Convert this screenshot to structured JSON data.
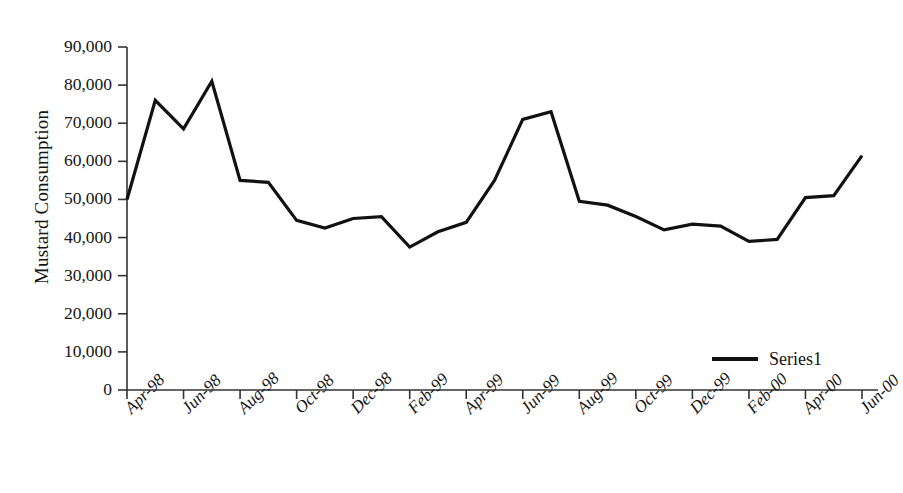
{
  "chart_data": {
    "type": "line",
    "title": "",
    "xlabel": "",
    "ylabel": "Mustard Consumption",
    "ylim": [
      0,
      90000
    ],
    "grid": false,
    "legend_position": "bottom-right",
    "y_ticks": [
      "0",
      "10,000",
      "20,000",
      "30,000",
      "40,000",
      "50,000",
      "60,000",
      "70,000",
      "80,000",
      "90,000"
    ],
    "y_tick_values": [
      0,
      10000,
      20000,
      30000,
      40000,
      50000,
      60000,
      70000,
      80000,
      90000
    ],
    "x_tick_labels": [
      "Apr-98",
      "Jun-98",
      "Aug-98",
      "Oct-98",
      "Dec-98",
      "Feb-99",
      "Apr-99",
      "Jun-99",
      "Aug-99",
      "Oct-99",
      "Dec-99",
      "Feb-00",
      "Apr-00",
      "Jun-00"
    ],
    "x_tick_interval_months": 2,
    "categories": [
      "Apr-98",
      "May-98",
      "Jun-98",
      "Jul-98",
      "Aug-98",
      "Sep-98",
      "Oct-98",
      "Nov-98",
      "Dec-98",
      "Jan-99",
      "Feb-99",
      "Mar-99",
      "Apr-99",
      "May-99",
      "Jun-99",
      "Jul-99",
      "Aug-99",
      "Sep-99",
      "Oct-99",
      "Nov-99",
      "Dec-99",
      "Jan-00",
      "Feb-00",
      "Mar-00",
      "Apr-00",
      "May-00",
      "Jun-00"
    ],
    "series": [
      {
        "name": "Series1",
        "color": "#111111",
        "values": [
          50000,
          76000,
          68500,
          81000,
          55000,
          54500,
          44500,
          42500,
          45000,
          45500,
          37500,
          41500,
          44000,
          55000,
          71000,
          73000,
          49500,
          48500,
          45500,
          42000,
          43500,
          43000,
          39000,
          39500,
          50500,
          51000,
          61500
        ]
      }
    ]
  },
  "legend": {
    "entries": [
      {
        "label": "Series1",
        "color": "#111111"
      }
    ]
  }
}
